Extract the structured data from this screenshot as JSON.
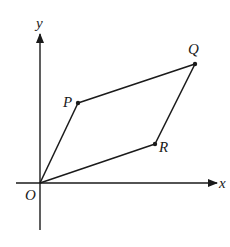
{
  "diagram": {
    "type": "coordinate-parallelogram",
    "axes": {
      "x_label": "x",
      "y_label": "y",
      "origin_label": "O"
    },
    "points": [
      {
        "label": "O",
        "x": 40,
        "y": 183
      },
      {
        "label": "P",
        "x": 78,
        "y": 103
      },
      {
        "label": "Q",
        "x": 195,
        "y": 64
      },
      {
        "label": "R",
        "x": 155,
        "y": 144
      }
    ],
    "edges": [
      [
        "O",
        "P"
      ],
      [
        "P",
        "Q"
      ],
      [
        "Q",
        "R"
      ],
      [
        "R",
        "O"
      ]
    ],
    "colors": {
      "ink": "#1a1a1a",
      "background": "#ffffff"
    }
  }
}
